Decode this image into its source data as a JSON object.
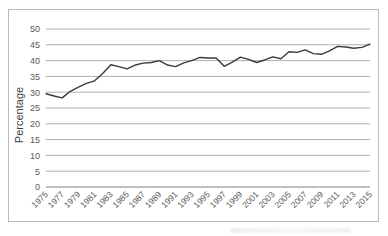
{
  "chart_data": {
    "type": "line",
    "title": "",
    "xlabel": "",
    "ylabel": "Percentage",
    "ylim": [
      0,
      50
    ],
    "ytick_step": 5,
    "yticks": [
      0,
      5,
      10,
      15,
      20,
      25,
      30,
      35,
      40,
      45,
      50
    ],
    "grid": true,
    "grid_axis": "y",
    "legend": false,
    "legend_position": "none",
    "xtick_labels": [
      "1975",
      "1977",
      "1979",
      "1981",
      "1983",
      "1985",
      "1987",
      "1989",
      "1991",
      "1993",
      "1995",
      "1997",
      "1999",
      "2001",
      "2003",
      "2005",
      "2007",
      "2009",
      "2011",
      "2013",
      "2015"
    ],
    "xtick_label_step": 2,
    "xtick_rotation": -45,
    "x": [
      1975,
      1976,
      1977,
      1978,
      1979,
      1980,
      1981,
      1982,
      1983,
      1984,
      1985,
      1986,
      1987,
      1988,
      1989,
      1990,
      1991,
      1992,
      1993,
      1994,
      1995,
      1996,
      1997,
      1998,
      1999,
      2000,
      2001,
      2002,
      2003,
      2004,
      2005,
      2006,
      2007,
      2008,
      2009,
      2010,
      2011,
      2012,
      2013,
      2014,
      2015
    ],
    "values": [
      29.5,
      28.8,
      28.2,
      30.3,
      31.6,
      32.8,
      33.6,
      35.9,
      38.7,
      38.1,
      37.4,
      38.6,
      39.2,
      39.4,
      40.0,
      38.6,
      38.1,
      39.3,
      40.0,
      41.0,
      40.8,
      40.8,
      38.2,
      39.5,
      41.1,
      40.4,
      39.4,
      40.2,
      41.2,
      40.6,
      42.8,
      42.6,
      43.4,
      42.2,
      42.0,
      43.1,
      44.5,
      44.3,
      43.9,
      44.2,
      45.2
    ],
    "series_color": "#3a3a3a",
    "grid_color": "#a6a6a6",
    "axis_color": "#808080",
    "frame_color": "#b9b9b9",
    "tick_text_color": "#595959",
    "axis_label_color": "#3f3f3f"
  }
}
